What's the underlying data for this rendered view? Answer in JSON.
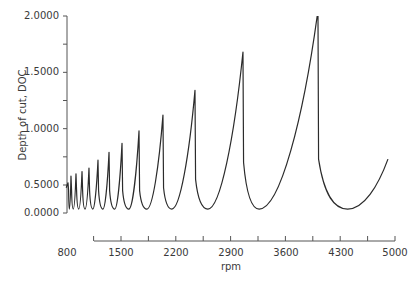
{
  "chart_data": {
    "type": "line",
    "title": "",
    "xlabel": "rpm",
    "ylabel": "Depth of cut, DOC",
    "xlim": [
      800,
      5000
    ],
    "ylim": [
      0.0,
      2.0
    ],
    "grid": false,
    "legend": null,
    "x_ticks": [
      800,
      1500,
      2200,
      2900,
      3600,
      4300,
      5000
    ],
    "x_tick_labels": [
      "800",
      "1500",
      "2200",
      "2900",
      "3600",
      "4300",
      "5000"
    ],
    "y_ticks": [
      0.0,
      0.5,
      1.0,
      1.5,
      2.0
    ],
    "y_tick_labels": [
      "0.0000",
      "0.5000",
      "1.0000",
      "1.5000",
      "2.0000"
    ],
    "series": [
      {
        "name": "Stability lobes",
        "color": "#2b2b2b",
        "peaks": [
          {
            "rpm": 823,
            "doc": 0.52
          },
          {
            "rpm": 861,
            "doc": 0.58
          },
          {
            "rpm": 925,
            "doc": 0.6
          },
          {
            "rpm": 1002,
            "doc": 0.62
          },
          {
            "rpm": 1091,
            "doc": 0.65
          },
          {
            "rpm": 1206,
            "doc": 0.72
          },
          {
            "rpm": 1347,
            "doc": 0.79
          },
          {
            "rpm": 1513,
            "doc": 0.87
          },
          {
            "rpm": 1730,
            "doc": 0.98
          },
          {
            "rpm": 2036,
            "doc": 1.12
          },
          {
            "rpm": 2445,
            "doc": 1.34
          },
          {
            "rpm": 3058,
            "doc": 1.68
          },
          {
            "rpm": 4016,
            "doc": 2.05
          }
        ],
        "minima": [
          {
            "rpm": 800,
            "doc": 0.45
          },
          {
            "rpm": 840,
            "doc": 0.07
          },
          {
            "rpm": 890,
            "doc": 0.07
          },
          {
            "rpm": 960,
            "doc": 0.07
          },
          {
            "rpm": 1040,
            "doc": 0.07
          },
          {
            "rpm": 1140,
            "doc": 0.07
          },
          {
            "rpm": 1270,
            "doc": 0.07
          },
          {
            "rpm": 1420,
            "doc": 0.07
          },
          {
            "rpm": 1600,
            "doc": 0.07
          },
          {
            "rpm": 1830,
            "doc": 0.07
          },
          {
            "rpm": 2150,
            "doc": 0.07
          },
          {
            "rpm": 2610,
            "doc": 0.07
          },
          {
            "rpm": 3265,
            "doc": 0.07
          },
          {
            "rpm": 4395,
            "doc": 0.07
          }
        ],
        "end_point": {
          "rpm": 4910,
          "doc": 0.73
        },
        "drop_depth_after_peak": [
          0.4,
          0.4,
          0.4,
          0.4,
          0.4,
          0.4,
          0.4,
          0.4,
          0.4,
          0.45,
          0.55,
          0.7,
          0.73
        ]
      }
    ]
  }
}
